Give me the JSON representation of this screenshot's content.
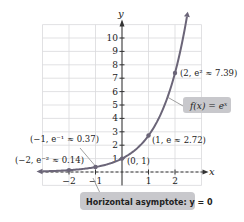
{
  "chart_data": {
    "type": "line",
    "title": "",
    "xlabel": "x",
    "ylabel": "y",
    "xlim": [
      -3,
      3
    ],
    "ylim": [
      -1,
      11
    ],
    "grid": true,
    "x_ticks": [
      {
        "value": -2,
        "label": "−2"
      },
      {
        "value": -1,
        "label": "−1"
      },
      {
        "value": 1,
        "label": "1"
      },
      {
        "value": 2,
        "label": "2"
      }
    ],
    "y_ticks": [
      {
        "value": 1,
        "label": "1"
      },
      {
        "value": 2,
        "label": "2"
      },
      {
        "value": 3,
        "label": "3"
      },
      {
        "value": 4,
        "label": "4"
      },
      {
        "value": 5,
        "label": "5"
      },
      {
        "value": 6,
        "label": "6"
      },
      {
        "value": 7,
        "label": "7"
      },
      {
        "value": 8,
        "label": "8"
      },
      {
        "value": 9,
        "label": "9"
      },
      {
        "value": 10,
        "label": "10"
      }
    ],
    "series": [
      {
        "name": "f(x) = e^x",
        "function": "exp",
        "domain": [
          -3,
          2.45
        ],
        "color": "#6b6578"
      }
    ],
    "points": [
      {
        "x": -2,
        "y": 0.14,
        "label": "(−2, e⁻² ≈ 0.14)"
      },
      {
        "x": -1,
        "y": 0.37,
        "label": "(−1, e⁻¹ ≈ 0.37)"
      },
      {
        "x": 0,
        "y": 1,
        "label": "(0, 1)"
      },
      {
        "x": 1,
        "y": 2.72,
        "label": "(1, e ≈ 2.72)"
      },
      {
        "x": 2,
        "y": 7.39,
        "label": "(2, e² ≈ 7.39)"
      }
    ],
    "annotations": {
      "function_label": "f(x) = eˣ",
      "asymptote_label": "Horizontal asymptote: y = 0",
      "asymptote_y": 0
    }
  }
}
